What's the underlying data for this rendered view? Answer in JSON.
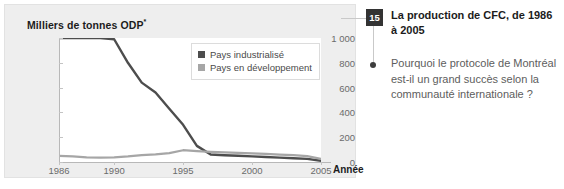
{
  "chart_data": {
    "type": "line",
    "title": "",
    "ylabel": "Milliers de tonnes ODP",
    "ylabel_superscript": "*",
    "xlabel": "Année",
    "xlim": [
      1986,
      2005
    ],
    "ylim": [
      0,
      1000
    ],
    "yticks": [
      1000,
      800,
      600,
      400,
      200,
      0
    ],
    "ytick_labels": [
      "1 000",
      "800",
      "600",
      "400",
      "200",
      "0"
    ],
    "xticks": [
      1986,
      1990,
      1995,
      2000,
      2005
    ],
    "xtick_labels": [
      "1986",
      "1990",
      "1995",
      "2000",
      "2005"
    ],
    "grid": false,
    "legend_position": "top-right",
    "series": [
      {
        "name": "Pays industrialisé",
        "color": "#4d4d4d",
        "x": [
          1986,
          1987,
          1988,
          1989,
          1990,
          1991,
          1992,
          1993,
          1994,
          1995,
          1996,
          1997,
          1998,
          1999,
          2000,
          2001,
          2002,
          2003,
          2004,
          2005
        ],
        "values": [
          1000,
          1000,
          1000,
          1000,
          990,
          800,
          640,
          560,
          430,
          300,
          130,
          60,
          55,
          50,
          45,
          40,
          35,
          30,
          25,
          10
        ]
      },
      {
        "name": "Pays en développement",
        "color": "#a6a6a6",
        "x": [
          1986,
          1987,
          1988,
          1989,
          1990,
          1991,
          1992,
          1993,
          1994,
          1995,
          1996,
          1997,
          1998,
          1999,
          2000,
          2001,
          2002,
          2003,
          2004,
          2005
        ],
        "values": [
          50,
          45,
          38,
          35,
          38,
          45,
          55,
          62,
          72,
          95,
          88,
          82,
          78,
          74,
          70,
          66,
          60,
          55,
          48,
          25
        ]
      }
    ]
  },
  "legend": {
    "items": [
      {
        "label": "Pays industrialisé",
        "color": "#4d4d4d"
      },
      {
        "label": "Pays en développement",
        "color": "#a6a6a6"
      }
    ]
  },
  "question": {
    "number": "15",
    "title": "La production de CFC, de 1986 à 2005",
    "body": "Pourquoi le protocole de Montréal est-il un grand succès selon la communauté internationale ?"
  },
  "colors": {
    "panel_background": "#eeeeee",
    "plot_background": "#ffffff",
    "badge_background": "#333333",
    "axis": "#b8b8b8",
    "series_industrial": "#4d4d4d",
    "series_developing": "#a6a6a6"
  }
}
